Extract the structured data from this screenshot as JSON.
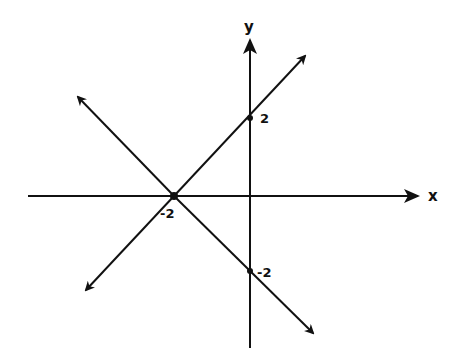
{
  "diagram": {
    "type": "coordinate-plane",
    "style": "hand-drawn",
    "ink_color": "#111111",
    "background": "#ffffff",
    "axes": {
      "x_label": "x",
      "y_label": "y"
    },
    "origin_px": [
      250,
      196
    ],
    "unit_px": 38,
    "lines": [
      {
        "name": "line-a",
        "equation": "y = x + 2",
        "from": [
          86,
          290
        ],
        "to": [
          305,
          56
        ]
      },
      {
        "name": "line-b",
        "equation": "y = -x - 2",
        "from": [
          78,
          97
        ],
        "to": [
          313,
          333
        ]
      }
    ],
    "points": [
      {
        "name": "x-intercept",
        "label": "-2",
        "coords": [
          -2,
          0
        ],
        "px": [
          174,
          196
        ]
      },
      {
        "name": "y-intercept-pos",
        "label": "2",
        "coords": [
          0,
          2
        ],
        "px": [
          250,
          118
        ]
      },
      {
        "name": "y-intercept-neg",
        "label": "-2",
        "coords": [
          0,
          -2
        ],
        "px": [
          250,
          271
        ]
      }
    ]
  }
}
